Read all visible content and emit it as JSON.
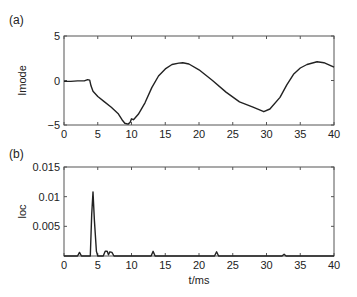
{
  "figure": {
    "panel_a_label": "(a)",
    "panel_b_label": "(b)"
  },
  "chart_data": [
    {
      "type": "line",
      "panel": "(a)",
      "title": "",
      "xlabel": "",
      "ylabel": "Imode",
      "xlim": [
        0,
        40
      ],
      "ylim": [
        -5,
        5
      ],
      "xticks": [
        0,
        5,
        10,
        15,
        20,
        25,
        30,
        35,
        40
      ],
      "xtick_labels": [
        "0",
        "5",
        "10",
        "15",
        "20",
        "25",
        "30",
        "35",
        "40"
      ],
      "yticks": [
        -5,
        0,
        5
      ],
      "ytick_labels": [
        "−5",
        "0",
        "5"
      ],
      "grid": false,
      "series": [
        {
          "name": "Imode",
          "x": [
            0,
            1,
            2,
            3,
            3.5,
            3.8,
            4.0,
            4.3,
            5,
            6,
            7,
            8,
            8.6,
            9.0,
            9.5,
            9.8,
            10.0,
            10.3,
            11,
            12,
            13,
            14,
            15,
            16,
            17,
            17.6,
            18.5,
            20,
            22,
            24,
            26,
            28,
            29.6,
            30.5,
            32,
            33,
            34,
            35,
            36,
            37.5,
            38.5,
            40
          ],
          "y": [
            -0.1,
            -0.1,
            -0.05,
            -0.05,
            0.1,
            0.05,
            -0.6,
            -1.2,
            -1.8,
            -2.4,
            -3.0,
            -3.7,
            -4.4,
            -4.8,
            -4.9,
            -4.7,
            -4.3,
            -4.4,
            -3.8,
            -2.5,
            -0.8,
            0.5,
            1.3,
            1.8,
            1.95,
            2.0,
            1.85,
            1.2,
            0.0,
            -1.3,
            -2.4,
            -3.0,
            -3.5,
            -3.2,
            -1.9,
            -0.5,
            0.7,
            1.4,
            1.8,
            2.1,
            2.0,
            1.5
          ]
        }
      ]
    },
    {
      "type": "line",
      "panel": "(b)",
      "title": "",
      "xlabel": "t/ms",
      "ylabel": "loc",
      "xlim": [
        0,
        40
      ],
      "ylim": [
        0,
        0.015
      ],
      "xticks": [
        0,
        5,
        10,
        15,
        20,
        25,
        30,
        35,
        40
      ],
      "xtick_labels": [
        "0",
        "5",
        "10",
        "15",
        "20",
        "25",
        "30",
        "35",
        "40"
      ],
      "yticks": [
        0.005,
        0.01,
        0.015
      ],
      "ytick_labels": [
        "0.005",
        "0.01",
        "0.015"
      ],
      "grid": false,
      "series": [
        {
          "name": "loc",
          "x": [
            0,
            2.0,
            2.3,
            2.6,
            3.9,
            4.1,
            4.3,
            4.5,
            4.8,
            5.0,
            5.8,
            6.1,
            6.4,
            6.6,
            6.8,
            7.1,
            7.4,
            12.9,
            13.2,
            13.5,
            22.3,
            22.6,
            22.9,
            32.3,
            32.6,
            32.9,
            40
          ],
          "y": [
            0,
            0,
            0.0006,
            0,
            0,
            0.007,
            0.0108,
            0.006,
            0.0008,
            0,
            0,
            0.0008,
            0.0008,
            0.0002,
            0.0007,
            0.0006,
            0,
            0,
            0.0008,
            0,
            0,
            0.0007,
            0,
            0,
            0.0003,
            0,
            0
          ]
        }
      ]
    }
  ]
}
